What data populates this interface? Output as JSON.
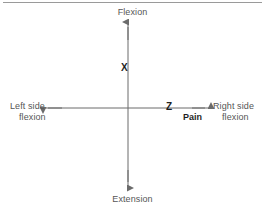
{
  "diagram": {
    "background_color": "#ffffff",
    "line_color": "#6b6b6b",
    "text_color": "#565656",
    "marker_color": "#1f1f1f",
    "axes": {
      "vertical": {
        "name": "flexion-extension-axis",
        "top_label": "Flexion",
        "bottom_label": "Extension",
        "x": 128,
        "y_top": 21,
        "y_bottom": 188
      },
      "horizontal": {
        "name": "lateral-flexion-axis",
        "left_label_line1": "Left side",
        "left_label_line2": "flexion",
        "right_label_line1": "Right side",
        "right_label_line2": "flexion",
        "y": 108,
        "x_left": 43,
        "x_right": 210
      }
    },
    "markers": [
      {
        "id": "x",
        "label": "X",
        "axis": "vertical",
        "x": 125,
        "y": 67
      },
      {
        "id": "z",
        "label": "Z",
        "axis": "horizontal",
        "x": 171,
        "y": 106
      },
      {
        "id": "pain",
        "label": "Pain",
        "axis": "horizontal",
        "x": 193,
        "y": 117
      }
    ],
    "top_rule": {
      "name": "top-divider",
      "color": "#9a9a9a"
    }
  },
  "labels": {
    "flexion": "Flexion",
    "extension": "Extension",
    "left_side": "Left side",
    "left_flexion": "flexion",
    "right_side": "Right side",
    "right_flexion": "flexion",
    "marker_x": "X",
    "marker_z": "Z",
    "marker_pain": "Pain"
  }
}
